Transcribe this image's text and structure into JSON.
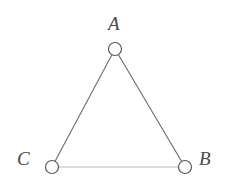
{
  "figure": {
    "type": "undirected-graph",
    "title": "",
    "background_color": "#ffffff",
    "width": 228,
    "height": 180
  },
  "nodes": [
    {
      "id": "A",
      "label": "A",
      "x": 115,
      "y": 49,
      "radius": 6.5,
      "fill": "#ffffff",
      "stroke": "#5a5a5a",
      "label_x": 108,
      "label_y": 14
    },
    {
      "id": "C",
      "label": "C",
      "x": 52,
      "y": 167,
      "radius": 6.5,
      "fill": "#ffffff",
      "stroke": "#5a5a5a",
      "label_x": 17,
      "label_y": 149
    },
    {
      "id": "B",
      "label": "B",
      "x": 185,
      "y": 167,
      "radius": 6.5,
      "fill": "#ffffff",
      "stroke": "#5a5a5a",
      "label_x": 199,
      "label_y": 149
    }
  ],
  "edges": [
    {
      "id": "edge-A-C",
      "from": "A",
      "to": "C",
      "color": "#6b6b6b",
      "width": 1.1
    },
    {
      "id": "edge-A-B",
      "from": "A",
      "to": "B",
      "color": "#6b6b6b",
      "width": 1.1
    },
    {
      "id": "edge-C-B",
      "from": "C",
      "to": "B",
      "color": "#b9b9b9",
      "width": 1.1
    }
  ],
  "colors": {
    "edge_dark": "#6b6b6b",
    "edge_light": "#b9b9b9",
    "node_stroke": "#5a5a5a",
    "node_fill": "#ffffff",
    "label_text": "#4a4a4a"
  }
}
